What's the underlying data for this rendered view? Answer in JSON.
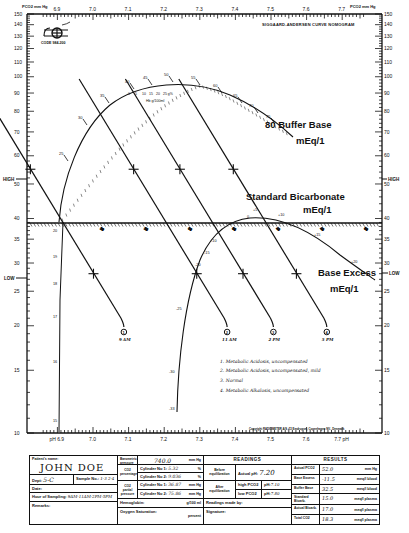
{
  "chart_data": {
    "type": "nomogram",
    "title": "SIGGAARD-ANDERSEN CURVE NOMOGRAM",
    "logo_text": "CODE 984-200",
    "xlabel": "pH",
    "ylabel": "PCO2 mm Hg",
    "y_scale": "log",
    "ylim": [
      10,
      150
    ],
    "xlim": [
      6.85,
      7.75
    ],
    "x_ticks": [
      "6.9",
      "7.0",
      "7.1",
      "7.2",
      "7.3",
      "7.4",
      "7.5",
      "7.6",
      "7.7"
    ],
    "x_tick_values": [
      6.9,
      7.0,
      7.1,
      7.2,
      7.3,
      7.4,
      7.5,
      7.6,
      7.7
    ],
    "bottom_x_labels": [
      "pH 6.9",
      "7.0",
      "7.1",
      "7.2",
      "7.3",
      "7.4",
      "7.5",
      "7.6",
      "7.7 pH"
    ],
    "y_ticks": [
      "150",
      "140",
      "130",
      "120",
      "110",
      "100",
      "90",
      "80",
      "70",
      "60",
      "50",
      "40",
      "35",
      "30",
      "25",
      "20",
      "15",
      "10"
    ],
    "y_tick_values": [
      150,
      140,
      130,
      120,
      110,
      100,
      90,
      80,
      70,
      60,
      50,
      40,
      35,
      30,
      25,
      20,
      15,
      10
    ],
    "axis_markers": {
      "high": "HIGH",
      "low": "LOW"
    },
    "curves": {
      "buffer_base": {
        "label": "Buffer Base",
        "unit": "mEq/1",
        "end_value": "80",
        "tick_labels": [
          "25",
          "30",
          "35",
          "40",
          "45",
          "50",
          "55",
          "60",
          "65",
          "70",
          "75"
        ]
      },
      "hemoglobin_scale": {
        "labels": [
          "0",
          "5",
          "10",
          "15",
          "20",
          "25 g%"
        ],
        "caption": "Hb g/100ml"
      },
      "standard_bicarbonate": {
        "label": "Standard Bicarbonate",
        "unit": "mEq/1",
        "tick_labels": [
          "20",
          "25",
          "30",
          "35",
          "40",
          "45",
          "50"
        ]
      },
      "pco2_40_line_labels": [
        "20",
        "19",
        "18",
        "17",
        "16",
        "15"
      ],
      "base_excess": {
        "label": "Base Excess",
        "unit": "mEq/1",
        "tick_labels": [
          "-33",
          "-30",
          "-25",
          "-20",
          "-15",
          "-10",
          "-5",
          "0",
          "+5",
          "+10",
          "+15",
          "+20"
        ]
      }
    },
    "series": [
      {
        "name": "9 AM",
        "marker": "1",
        "pH_at_pco2_40": 6.98,
        "points": [
          {
            "pco2": 55,
            "pH": 7.08
          },
          {
            "pco2": 28,
            "pH": 7.2
          }
        ]
      },
      {
        "name": "11 AM",
        "marker": "2",
        "pH_at_pco2_40": 7.27,
        "points": [
          {
            "pco2": 55,
            "pH": 7.18
          },
          {
            "pco2": 28,
            "pH": 7.3
          }
        ]
      },
      {
        "name": "2 PM",
        "marker": "3",
        "pH_at_pco2_40": 7.4,
        "points": [
          {
            "pco2": 55,
            "pH": 7.28
          },
          {
            "pco2": 28,
            "pH": 7.4
          }
        ]
      },
      {
        "name": "5 PM",
        "marker": "4",
        "pH_at_pco2_40": 7.55,
        "points": [
          {
            "pco2": 55,
            "pH": 7.38
          },
          {
            "pco2": 28,
            "pH": 7.5
          }
        ]
      }
    ],
    "legend": [
      "1. Metabolic Acidosis, uncompensated",
      "2. Metabolic Acidosis, uncompensated, mild",
      "3. Normal",
      "4. Metabolic Alkalosis, uncompensated"
    ],
    "copyright": "Copyright RADIOMETER A/S, 72 Emdrupvej, Copenhagen NV., Denmark"
  },
  "form": {
    "patient_name_label": "Patient's name:",
    "patient_name": "JOHN DOE",
    "dept_label": "Dept:",
    "dept_value": "5-C",
    "sample_no_label": "Sample No.:",
    "sample_no_value": "1-3 2-4",
    "date_label": "Date:",
    "hour_label": "Hour of Sampling:",
    "hour_value": "9AM-11AM-2PM-5PM",
    "remarks_label": "Remarks:",
    "barometric_label": "Barometric pressure",
    "barometric_value": "740.0",
    "barometric_unit": "mm Hg",
    "co2_pct_label": "CO2 percentage",
    "cyl1_label": "Cylinder No 1:",
    "cyl1_pct": "5.32",
    "cyl2_label": "Cylinder No 2:",
    "cyl2_pct": "9.036",
    "pct_unit": "%",
    "co2_partial_label": "CO2 partial pressure",
    "cyl1_pp": "36.87",
    "cyl2_pp": "75.86",
    "pp_unit": "mm Hg",
    "hemoglobin_label": "Hemoglobin:",
    "hemoglobin_unit": "g/100 ml",
    "oxygen_label": "Oxygen Saturation:",
    "oxygen_unit": "percent",
    "readings_header": "READINGS",
    "before_eq_label": "Before equilibration",
    "actual_ph_label": "Actual pH:",
    "actual_ph_value": "7.20",
    "after_eq_label": "After equilibration",
    "high_pco2_label": "high PCO2",
    "low_pco2_label": "low PCO2",
    "high_ph_label": "pH:",
    "high_ph_value": "7.10",
    "low_ph_value": "7.80",
    "readings_by_label": "Readings made by:",
    "signature_label": "Signature:",
    "results_header": "RESULTS",
    "results": [
      {
        "label": "Actual PCO2",
        "value": "52.0",
        "unit": "mm Hg"
      },
      {
        "label": "Base Excess",
        "value": "-11.5",
        "unit": "meq/l blood"
      },
      {
        "label": "Buffer Base",
        "value": "32.5",
        "unit": "meq/l blood"
      },
      {
        "label": "Standard Bicarb.",
        "value": "15.0",
        "unit": "meq/l plasma"
      },
      {
        "label": "Actual Bicarb.",
        "value": "17.0",
        "unit": "meq/l plasma"
      },
      {
        "label": "Total CO2",
        "value": "18.3",
        "unit": "meq/l plasma"
      }
    ]
  }
}
